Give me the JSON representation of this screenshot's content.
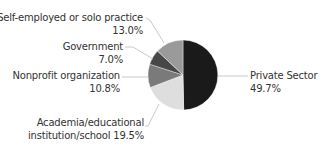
{
  "chart_data": {
    "type": "pie",
    "title": "",
    "start_angle_deg": 0,
    "direction": "clockwise",
    "slices": [
      {
        "label": "Private Sector",
        "value": 49.7,
        "display": "49.7%",
        "color": "#1a1a1a"
      },
      {
        "label": "Academia/educational institution/school",
        "value": 19.5,
        "display": "19.5%",
        "color": "#dedede"
      },
      {
        "label": "Nonprofit organization",
        "value": 10.8,
        "display": "10.8%",
        "color": "#7a7a7a"
      },
      {
        "label": "Government",
        "value": 7.0,
        "display": "7.0%",
        "color": "#474747"
      },
      {
        "label": "Self-employed or solo practice",
        "value": 13.0,
        "display": "13.0%",
        "color": "#9a9a9a"
      }
    ],
    "legend": "none (callout labels with leader lines)"
  },
  "labels": {
    "self_employed": {
      "name": "Self-employed or solo practice",
      "pct": "13.0%"
    },
    "government": {
      "name": "Government",
      "pct": "7.0%"
    },
    "nonprofit": {
      "name": "Nonprofit organization",
      "pct": "10.8%"
    },
    "academia": {
      "line1": "Academia/educational",
      "line2": "institution/school 19.5%"
    },
    "private": {
      "name": "Private Sector",
      "pct": "49.7%"
    }
  }
}
